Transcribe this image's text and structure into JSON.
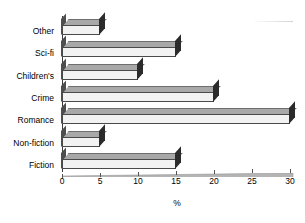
{
  "chart_data": {
    "type": "bar",
    "orientation": "horizontal",
    "style": "3d-bar",
    "title": "",
    "xlabel": "%",
    "ylabel": "",
    "xlim": [
      0,
      30
    ],
    "xticks": [
      0,
      5,
      10,
      15,
      20,
      25,
      30
    ],
    "grid": false,
    "legend": null,
    "categories": [
      "Fiction",
      "Non-fiction",
      "Romance",
      "Crime",
      "Children's",
      "Sci-fi",
      "Other"
    ],
    "values": [
      15,
      5,
      30,
      20,
      10,
      15,
      5
    ],
    "display_order_top_to_bottom": [
      "Other",
      "Sci-fi",
      "Children's",
      "Crime",
      "Romance",
      "Non-fiction",
      "Fiction"
    ],
    "display_values_top_to_bottom": [
      5,
      15,
      10,
      20,
      30,
      5,
      15
    ]
  },
  "axis": {
    "x_tick_labels": [
      "0",
      "5",
      "10",
      "15",
      "20",
      "25",
      "30"
    ],
    "x_title": "%"
  },
  "colors": {
    "bar_front": "#f2f2f2",
    "bar_top": "#a8a8a8",
    "bar_cap": "#2b2b2b",
    "axis": "#3a3a3a",
    "text": "#000000",
    "background": "#ffffff"
  }
}
